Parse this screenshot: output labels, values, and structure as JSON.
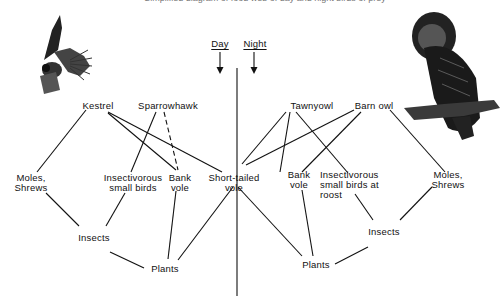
{
  "clipped_caption": "Simplified diagram of food web of day and night birds of prey",
  "header": {
    "day_label": "Day",
    "night_label": "Night"
  },
  "illustrations": {
    "left": "kestrel-illustration",
    "right": "tawny-owl-illustration"
  },
  "nodes": {
    "kestrel": "Kestrel",
    "sparrowhawk": "Sparrowhawk",
    "tawny_owl": "Tawnyowl",
    "barn_owl": "Barn owl",
    "moles_shrews_left": "Moles,\nShrews",
    "insectivorous_left": "Insectivorous\nsmall birds",
    "bank_vole_left": "Bank\nvole",
    "short_tailed_vole": "Short-tailed\nvole",
    "bank_vole_right": "Bank\nvole",
    "insectivorous_right": "Insectivorous\nsmall birds at\nroost",
    "moles_shrews_right": "Moles,\nShrews",
    "insects_left": "Insects",
    "insects_right": "Insects",
    "plants_left": "Plants",
    "plants_right": "Plants"
  },
  "edges": [
    {
      "from": "Kestrel",
      "to": "Moles, Shrews",
      "style": "solid"
    },
    {
      "from": "Kestrel",
      "to": "Bank vole",
      "style": "solid"
    },
    {
      "from": "Kestrel",
      "to": "Short-tailed vole",
      "style": "solid"
    },
    {
      "from": "Sparrowhawk",
      "to": "Insectivorous small birds",
      "style": "solid"
    },
    {
      "from": "Sparrowhawk",
      "to": "Bank vole",
      "style": "dashed"
    },
    {
      "from": "Tawnyowl",
      "to": "Short-tailed vole",
      "style": "solid"
    },
    {
      "from": "Tawnyowl",
      "to": "Bank vole",
      "style": "solid"
    },
    {
      "from": "Tawnyowl",
      "to": "Insectivorous small birds at roost",
      "style": "solid"
    },
    {
      "from": "Barn owl",
      "to": "Short-tailed vole",
      "style": "solid"
    },
    {
      "from": "Barn owl",
      "to": "Bank vole",
      "style": "solid"
    },
    {
      "from": "Barn owl",
      "to": "Moles, Shrews",
      "style": "solid"
    },
    {
      "from": "Moles, Shrews",
      "to": "Insects",
      "style": "solid"
    },
    {
      "from": "Insectivorous small birds",
      "to": "Insects",
      "style": "solid"
    },
    {
      "from": "Insects",
      "to": "Plants",
      "style": "solid"
    },
    {
      "from": "Bank vole",
      "to": "Plants",
      "style": "solid"
    },
    {
      "from": "Short-tailed vole",
      "to": "Plants (left)",
      "style": "solid"
    },
    {
      "from": "Short-tailed vole",
      "to": "Plants (right)",
      "style": "solid"
    },
    {
      "from": "Bank vole (right)",
      "to": "Plants (right)",
      "style": "solid"
    },
    {
      "from": "Insectivorous small birds at roost",
      "to": "Insects (right)",
      "style": "solid"
    },
    {
      "from": "Moles, Shrews (right)",
      "to": "Insects (right)",
      "style": "solid"
    },
    {
      "from": "Insects (right)",
      "to": "Plants (right)",
      "style": "solid"
    }
  ]
}
